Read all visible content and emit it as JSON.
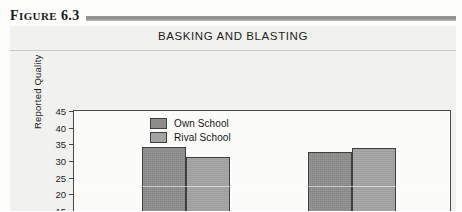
{
  "figure": {
    "label_prefix": "F",
    "label_rest": "IGURE",
    "number": "6.3"
  },
  "title": "BASKING AND BLASTING",
  "legend": {
    "position": "inside-top-center",
    "items": [
      {
        "label": "Own School",
        "color": "#8d8d8d"
      },
      {
        "label": "Rival School",
        "color": "#a3a3a3"
      }
    ]
  },
  "chart_data": {
    "type": "bar",
    "title": "BASKING AND BLASTING",
    "xlabel": "",
    "ylabel": "Reported Quality",
    "ylim": [
      0,
      45
    ],
    "ytick_labels": [
      "45",
      "40",
      "35",
      "30",
      "25",
      "20",
      "15",
      "10",
      "5",
      "0"
    ],
    "ytick_values": [
      45,
      40,
      35,
      30,
      25,
      20,
      15,
      10,
      5,
      0
    ],
    "grid": false,
    "categories": [
      "Group 1",
      "Group 2"
    ],
    "series": [
      {
        "name": "Own School",
        "color": "#8d8d8d",
        "values": [
          34,
          32.5
        ]
      },
      {
        "name": "Rival School",
        "color": "#a3a3a3",
        "values": [
          31,
          33.5
        ]
      }
    ],
    "note": "Bottom of figure is cropped; x-axis category labels are not visible in the image."
  }
}
